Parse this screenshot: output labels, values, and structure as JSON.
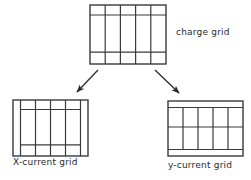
{
  "figure": {
    "title_present": false,
    "background_color": "#ffffff",
    "line_color": "#3a3a3a",
    "text_color": "#2a2a2a"
  },
  "labels": {
    "charge_grid": "charge grid",
    "x_current_grid": "X-current grid",
    "y_current_grid": "y-current grid"
  },
  "diagram_data": {
    "type": "staggered-grid-schematic",
    "description": "A charge grid at top with two arrows pointing down-left and down-right to an X-current grid and a y-current grid, each offset by half a cell.",
    "grids": [
      {
        "name": "charge grid",
        "id": "charge",
        "x": 90,
        "y": 5,
        "width": 76,
        "height": 59,
        "columns": 5,
        "rows": 3,
        "column_edges": [
          0,
          0.2,
          0.4,
          0.6,
          0.8,
          1.0
        ],
        "row_edges": [
          0,
          0.17,
          0.8,
          1.0
        ],
        "offset_axis": "none",
        "offset_fraction": 0
      },
      {
        "name": "X-current grid",
        "id": "xcurrent",
        "x": 13,
        "y": 100,
        "width": 75,
        "height": 56,
        "columns": 5,
        "rows": 3,
        "column_edges": [
          0,
          0.2,
          0.4,
          0.6,
          0.8,
          1.0
        ],
        "row_edges": [
          0,
          0.17,
          0.8,
          1.0
        ],
        "offset_axis": "x",
        "offset_fraction": 0.1
      },
      {
        "name": "y-current grid",
        "id": "ycurrent",
        "x": 168,
        "y": 101,
        "width": 75,
        "height": 55,
        "columns": 5,
        "rows": 3,
        "column_edges": [
          0,
          0.2,
          0.4,
          0.6,
          0.8,
          1.0
        ],
        "row_edges": [
          0,
          0.17,
          0.8,
          1.0
        ],
        "offset_axis": "y",
        "offset_fraction": 0.1
      }
    ],
    "arrows": [
      {
        "id": "arrow-to-xcurrent",
        "from_grid": "charge",
        "to_grid": "xcurrent",
        "x1": 98,
        "y1": 70,
        "x2": 76,
        "y2": 93,
        "direction": "down-left"
      },
      {
        "id": "arrow-to-ycurrent",
        "from_grid": "charge",
        "to_grid": "ycurrent",
        "x1": 155,
        "y1": 70,
        "x2": 180,
        "y2": 94,
        "direction": "down-right"
      }
    ]
  }
}
